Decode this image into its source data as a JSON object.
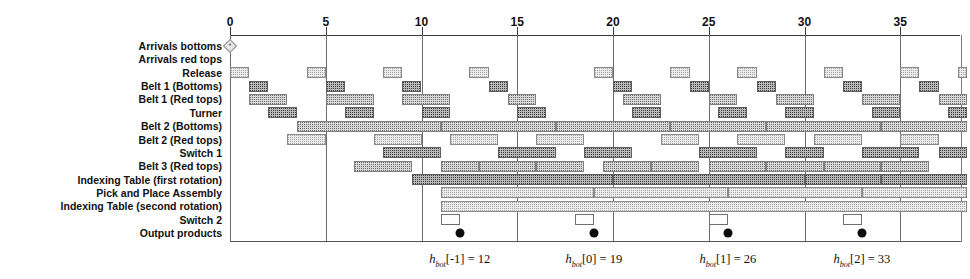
{
  "chart_data": {
    "type": "gantt",
    "title": "",
    "xlabel": "",
    "ylabel": "",
    "xlim": [
      -0.5,
      38.5
    ],
    "x_ticks": [
      0,
      5,
      10,
      15,
      20,
      25,
      30,
      35
    ],
    "x_tick_labels": [
      "0",
      "5",
      "10",
      "15",
      "20",
      "25",
      "30",
      "35"
    ],
    "grid": true,
    "grid_axis": "x",
    "legend": "none",
    "colors": {
      "bar_fill": "#d9d9d9",
      "bar_dark_fill": "#b9b9b9",
      "bar_light_fill": "#ececec",
      "bar_border": "#7f7f7f",
      "axis": "#3a3a3a",
      "marker": "#0c0c0c"
    },
    "rows": [
      {
        "label": "Arrivals bottoms",
        "style": "marker",
        "bars": [],
        "markers": [
          0
        ]
      },
      {
        "label": "Arrivals red tops",
        "style": "normal",
        "bars": []
      },
      {
        "label": "Release",
        "style": "light",
        "bars": [
          {
            "start": 0,
            "end": 1
          },
          {
            "start": 4,
            "end": 5
          },
          {
            "start": 8,
            "end": 9
          },
          {
            "start": 12.5,
            "end": 13.5
          },
          {
            "start": 19,
            "end": 20
          },
          {
            "start": 23,
            "end": 24
          },
          {
            "start": 26.5,
            "end": 27.5
          },
          {
            "start": 31,
            "end": 32
          },
          {
            "start": 35,
            "end": 36
          },
          {
            "start": 38,
            "end": 38.5
          }
        ]
      },
      {
        "label": "Belt 1 (Bottoms)",
        "style": "dark",
        "bars": [
          {
            "start": 1,
            "end": 2
          },
          {
            "start": 5,
            "end": 6
          },
          {
            "start": 9,
            "end": 10
          },
          {
            "start": 13.5,
            "end": 14.5
          },
          {
            "start": 20,
            "end": 21
          },
          {
            "start": 24,
            "end": 25
          },
          {
            "start": 27.5,
            "end": 28.5
          },
          {
            "start": 32,
            "end": 33
          },
          {
            "start": 36,
            "end": 37
          }
        ]
      },
      {
        "label": "Belt 1 (Red tops)",
        "style": "normal",
        "bars": [
          {
            "start": 1,
            "end": 3
          },
          {
            "start": 5,
            "end": 7.5
          },
          {
            "start": 9,
            "end": 11.5
          },
          {
            "start": 14.5,
            "end": 16
          },
          {
            "start": 20.5,
            "end": 22.5
          },
          {
            "start": 25,
            "end": 26.5
          },
          {
            "start": 28.5,
            "end": 30.5
          },
          {
            "start": 33,
            "end": 35
          },
          {
            "start": 37,
            "end": 38.5
          }
        ]
      },
      {
        "label": "Turner",
        "style": "dark",
        "bars": [
          {
            "start": 2,
            "end": 3.5
          },
          {
            "start": 6,
            "end": 7.5
          },
          {
            "start": 10,
            "end": 11.5
          },
          {
            "start": 15,
            "end": 16.5
          },
          {
            "start": 21,
            "end": 22.5
          },
          {
            "start": 25.5,
            "end": 27
          },
          {
            "start": 29,
            "end": 30.5
          },
          {
            "start": 33.5,
            "end": 35
          },
          {
            "start": 37.5,
            "end": 38.5
          }
        ]
      },
      {
        "label": "Belt 2 (Bottoms)",
        "style": "normal",
        "bars": [
          {
            "start": 3.5,
            "end": 11
          },
          {
            "start": 11,
            "end": 17
          },
          {
            "start": 17,
            "end": 23
          },
          {
            "start": 23,
            "end": 28
          },
          {
            "start": 28,
            "end": 34
          },
          {
            "start": 34,
            "end": 38.5
          }
        ]
      },
      {
        "label": "Belt 2 (Red tops)",
        "style": "light",
        "bars": [
          {
            "start": 3,
            "end": 5
          },
          {
            "start": 7.5,
            "end": 10
          },
          {
            "start": 11.5,
            "end": 14
          },
          {
            "start": 16,
            "end": 18.5
          },
          {
            "start": 22.5,
            "end": 24.5
          },
          {
            "start": 26.5,
            "end": 29
          },
          {
            "start": 30.5,
            "end": 33
          },
          {
            "start": 35,
            "end": 37
          }
        ]
      },
      {
        "label": "Switch 1",
        "style": "dark",
        "bars": [
          {
            "start": 8,
            "end": 11
          },
          {
            "start": 14,
            "end": 17
          },
          {
            "start": 18.5,
            "end": 21
          },
          {
            "start": 24.5,
            "end": 27.5
          },
          {
            "start": 29,
            "end": 31
          },
          {
            "start": 33,
            "end": 36
          },
          {
            "start": 37,
            "end": 38.5
          }
        ]
      },
      {
        "label": "Belt 3 (Red tops)",
        "style": "normal",
        "bars": [
          {
            "start": 6.5,
            "end": 9.5
          },
          {
            "start": 11,
            "end": 13
          },
          {
            "start": 13,
            "end": 16
          },
          {
            "start": 16,
            "end": 18.5
          },
          {
            "start": 19.5,
            "end": 22
          },
          {
            "start": 22,
            "end": 24.5
          },
          {
            "start": 25,
            "end": 28
          },
          {
            "start": 28,
            "end": 31
          },
          {
            "start": 31,
            "end": 34
          },
          {
            "start": 34,
            "end": 36.5
          }
        ]
      },
      {
        "label": "Indexing Table (first rotation)",
        "style": "dark",
        "bars": [
          {
            "start": 9.5,
            "end": 20
          },
          {
            "start": 20,
            "end": 30
          },
          {
            "start": 30,
            "end": 34
          },
          {
            "start": 34,
            "end": 38.5
          }
        ]
      },
      {
        "label": "Pick and Place Assembly",
        "style": "light",
        "bars": [
          {
            "start": 11,
            "end": 19
          },
          {
            "start": 19,
            "end": 26
          },
          {
            "start": 26,
            "end": 33
          },
          {
            "start": 33,
            "end": 38.5
          }
        ]
      },
      {
        "label": "Indexing Table (second rotation)",
        "style": "light",
        "bars": [
          {
            "start": 11,
            "end": 38.5
          }
        ]
      },
      {
        "label": "Switch 2",
        "style": "hollow",
        "bars": [
          {
            "start": 11,
            "end": 12
          },
          {
            "start": 18,
            "end": 19
          },
          {
            "start": 25,
            "end": 26
          },
          {
            "start": 32,
            "end": 33
          }
        ]
      },
      {
        "label": "Output products",
        "style": "marker-out",
        "bars": [],
        "markers": [
          12,
          19,
          26,
          33
        ]
      }
    ],
    "annotations": [
      {
        "x": 12,
        "text_plain": "h_bot[-1] = 12",
        "var": "h",
        "sub": "bot",
        "index": "[-1]",
        "value": "12"
      },
      {
        "x": 19,
        "text_plain": "h_bot[0] = 19",
        "var": "h",
        "sub": "bot",
        "index": "[0]",
        "value": "19"
      },
      {
        "x": 26,
        "text_plain": "h_bot[1] = 26",
        "var": "h",
        "sub": "bot",
        "index": "[1]",
        "value": "26"
      },
      {
        "x": 33,
        "text_plain": "h_bot[2] = 33",
        "var": "h",
        "sub": "bot",
        "index": "[2]",
        "value": "33"
      }
    ]
  }
}
